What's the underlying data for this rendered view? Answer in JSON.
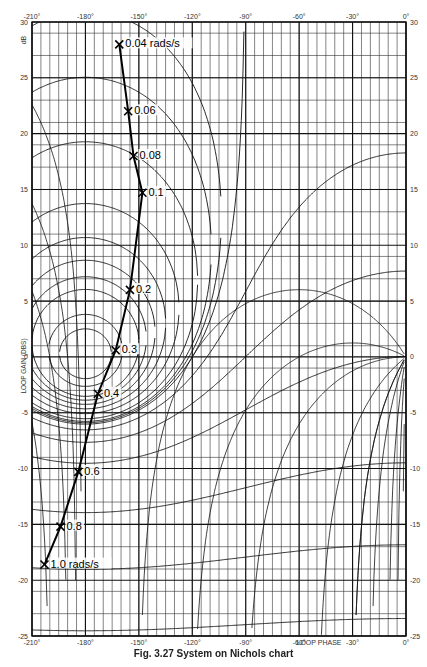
{
  "chart_data": {
    "type": "line",
    "subtype": "nichols_chart",
    "title": "",
    "caption": "Fig. 3.27 System on Nichols chart",
    "xlabel": "LOOP PHASE",
    "ylabel": "LOOP GAIN (DBS)",
    "yunit_label": "dB",
    "xlim": [
      -210,
      0
    ],
    "ylim": [
      -25,
      30
    ],
    "x_ticks": [
      -210,
      -180,
      -150,
      -120,
      -90,
      -60,
      -30,
      0
    ],
    "x_tick_labels": [
      "-210°",
      "-180°",
      "-150°",
      "-120°",
      "-90°",
      "-60°",
      "-30°",
      "0°"
    ],
    "y_ticks": [
      30,
      25,
      20,
      15,
      10,
      5,
      0,
      -5,
      -10,
      -15,
      -20,
      -25
    ],
    "y_tick_labels": [
      "30",
      "25",
      "20",
      "15",
      "10",
      "5",
      "0",
      "-5",
      "-10",
      "-15",
      "-20",
      "-25"
    ],
    "grid": true,
    "grid_minor_phase_step": 5,
    "grid_minor_gain_step": 1,
    "legend": "none",
    "series": [
      {
        "name": "Open-loop frequency response",
        "x": [
          -161,
          -156,
          -153,
          -148,
          -155,
          -163,
          -173,
          -184,
          -194,
          -203
        ],
        "y": [
          28,
          22,
          18,
          14.7,
          6,
          0.6,
          -3.3,
          -10.3,
          -15.2,
          -18.6
        ],
        "point_labels": [
          "0.04 rads/s",
          "0.06",
          "0.08",
          "0.1",
          "0.2",
          "0.3",
          "0.4",
          "0.6",
          "0.8",
          "1.0 rads/s"
        ],
        "marker": "x"
      }
    ],
    "m_contours_db": [
      12,
      9,
      6,
      5,
      4,
      3,
      2,
      1,
      0.5,
      0.25,
      0,
      -1,
      -3,
      -6,
      -12,
      -18,
      -24
    ],
    "phase_contours_deg": [
      -2,
      -5,
      -10,
      -20,
      -30,
      -50,
      -90,
      -120,
      -150,
      -180,
      -210
    ]
  },
  "axes_labels": {
    "top": [
      "-210°",
      "-180°",
      "-150°",
      "-120°",
      "-90°",
      "-60°",
      "-30°",
      "0°"
    ],
    "bottom": [
      "-210°",
      "-180°",
      "-150°",
      "-120°",
      "-90°",
      "-60°",
      "-30°",
      "0°"
    ],
    "left": [
      "30",
      "25",
      "20",
      "15",
      "10",
      "5",
      "0",
      "-5",
      "-10",
      "-15",
      "-20",
      "-25"
    ],
    "right": [
      "30",
      "25",
      "20",
      "15",
      "10",
      "5",
      "0",
      "-5",
      "-10",
      "-15",
      "-20",
      "-25"
    ],
    "unit": "dB",
    "ylabel": "LOOP GAIN (DBS)",
    "xlabel": "LOOP PHASE"
  },
  "caption": "Fig. 3.27 System on Nichols chart"
}
